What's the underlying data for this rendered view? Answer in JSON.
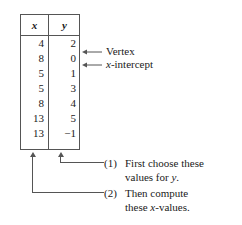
{
  "table": {
    "headers": [
      "x",
      "y"
    ],
    "rows": [
      {
        "x": "4",
        "y": "2"
      },
      {
        "x": "8",
        "y": "0"
      },
      {
        "x": "5",
        "y": "1"
      },
      {
        "x": "5",
        "y": "3"
      },
      {
        "x": "8",
        "y": "4"
      },
      {
        "x": "13",
        "y": "5"
      },
      {
        "x": "13",
        "y": "−1"
      }
    ]
  },
  "annotations": {
    "vertex": "Vertex",
    "x_intercept_prefix": "x",
    "x_intercept_suffix": "-intercept"
  },
  "steps": [
    {
      "number": "(1)",
      "line1": "First choose these",
      "line2_prefix": "values for ",
      "line2_italic": "y",
      "line2_suffix": "."
    },
    {
      "number": "(2)",
      "line1": "Then compute",
      "line2_prefix": "these ",
      "line2_italic": "x",
      "line2_suffix": "-values."
    }
  ],
  "colors": {
    "rule": "#555555",
    "text": "#1a1a1a",
    "background": "#ffffff"
  }
}
